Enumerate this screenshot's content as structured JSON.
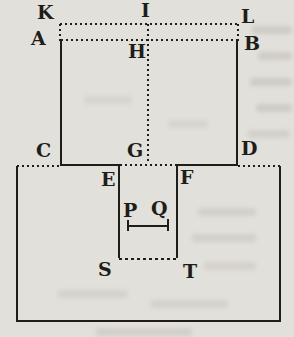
{
  "colors": {
    "paper": "#e2e0da",
    "ink": "#1f1d1a"
  },
  "figure": {
    "labels": {
      "K": "K",
      "I": "I",
      "L": "L",
      "A": "A",
      "H": "H",
      "B": "B",
      "C": "C",
      "G": "G",
      "D": "D",
      "E": "E",
      "F": "F",
      "P": "P",
      "Q": "Q",
      "S": "S",
      "T": "T"
    }
  }
}
